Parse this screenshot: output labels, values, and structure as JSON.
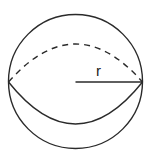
{
  "diagram": {
    "type": "sphere",
    "stroke_color": "#2a2a2a",
    "background": "#ffffff",
    "sphere": {
      "center": [
        75.5,
        81.5
      ],
      "radius": 67
    },
    "equator": {
      "front_arc": "solid",
      "back_arc": "dashed",
      "front_arc_lowest_y": 124,
      "back_arc_highest_y": 44
    },
    "radius_line": {
      "from": [
        75.5,
        82
      ],
      "to": [
        142.5,
        82
      ],
      "label": "r"
    }
  }
}
